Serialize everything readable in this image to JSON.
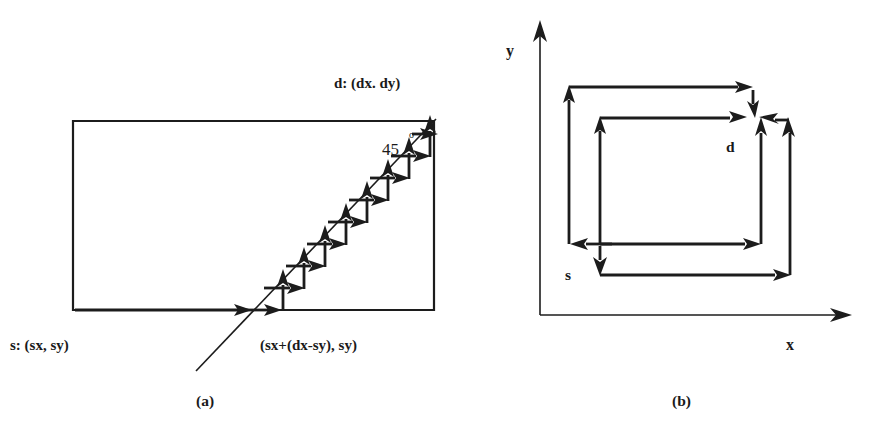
{
  "figure": {
    "background_color": "#ffffff",
    "ink_color": "#1c1c1c"
  },
  "panel_a": {
    "caption": "(a)",
    "labels": {
      "source": "s: (sx, sy)",
      "destination": "d: (dx. dy)",
      "crossing_point": "(sx+(dx-sy), sy)",
      "angle_value": "45",
      "angle_unit": "o"
    },
    "geometry": {
      "rect_left": 73,
      "rect_top": 121,
      "rect_right": 434,
      "rect_bottom": 310,
      "diagonal_start_x": 196,
      "diagonal_start_y": 371,
      "diagonal_end_x": 434,
      "diagonal_end_y": 121,
      "staircase_steps": 9,
      "bottom_arrow_from_x": 75,
      "bottom_arrow_to_x": 248
    }
  },
  "panel_b": {
    "caption": "(b)",
    "labels": {
      "x_axis": "x",
      "y_axis": "y",
      "source": "s",
      "destination": "d"
    },
    "geometry": {
      "axis_origin_x": 540,
      "axis_origin_y": 315,
      "x_axis_end": 852,
      "y_axis_end": 24,
      "outer_left": 569,
      "outer_top": 87,
      "outer_right": 790,
      "outer_bottom": 244,
      "inner_left": 600,
      "inner_top": 118,
      "inner_right": 761,
      "inner_bottom": 275,
      "converge_x": 760,
      "converge_y": 116
    }
  }
}
